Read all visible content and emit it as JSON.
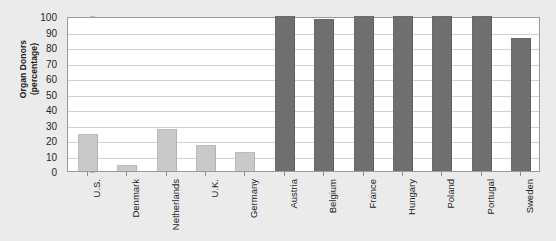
{
  "chart_data": {
    "type": "bar",
    "title": "",
    "xlabel": "",
    "ylabel": "Organ Donors (percentage)",
    "ylabel_lines": [
      "Organ Donors",
      "(percentage)"
    ],
    "ylim": [
      0,
      100
    ],
    "yticks": [
      0,
      10,
      20,
      30,
      40,
      50,
      60,
      70,
      80,
      90,
      100
    ],
    "grid": true,
    "legend": "none",
    "categories": [
      "U.S.",
      "Denmark",
      "Netherlands",
      "U.K.",
      "Germany",
      "Austria",
      "Belgium",
      "France",
      "Hungary",
      "Poland",
      "Portugal",
      "Sweden"
    ],
    "values": [
      24,
      4,
      27,
      17,
      12,
      100,
      98,
      100,
      100,
      100,
      100,
      86
    ],
    "bar_groups": [
      {
        "name": "opt-in",
        "color": "#c9c9c9",
        "categories": [
          "U.S.",
          "Denmark",
          "Netherlands",
          "U.K.",
          "Germany"
        ]
      },
      {
        "name": "opt-out",
        "color": "#6f6f6f",
        "categories": [
          "Austria",
          "Belgium",
          "France",
          "Hungary",
          "Poland",
          "Portugal",
          "Sweden"
        ]
      }
    ],
    "bar_colors": [
      "#c9c9c9",
      "#c9c9c9",
      "#c9c9c9",
      "#c9c9c9",
      "#c9c9c9",
      "#6f6f6f",
      "#6f6f6f",
      "#6f6f6f",
      "#6f6f6f",
      "#6f6f6f",
      "#6f6f6f",
      "#6f6f6f"
    ],
    "plot_background": "#ffffff",
    "figure_background": "#ebebeb",
    "grid_color": "#d0d0d0",
    "axis_color": "#9a9a9a"
  }
}
